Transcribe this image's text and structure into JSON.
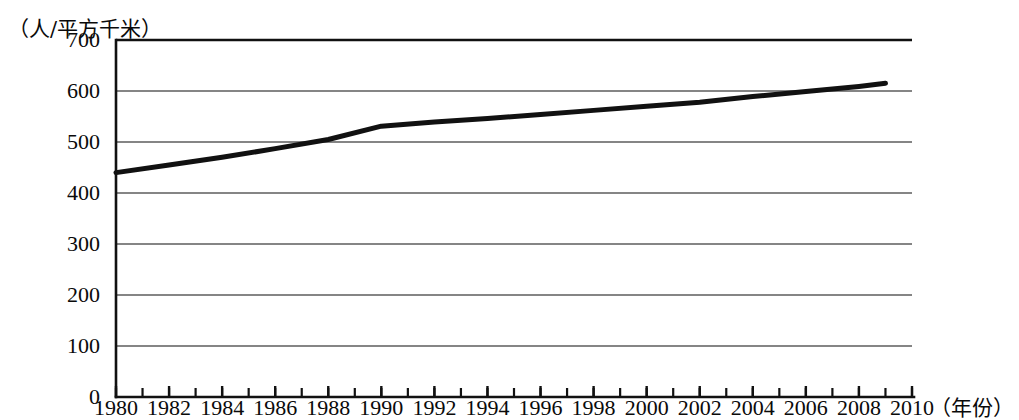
{
  "figure": {
    "y_axis_unit": "（人/平方千米）",
    "x_axis_unit": "（年份）"
  },
  "chart_data": {
    "type": "line",
    "title": "",
    "subtitle": "",
    "xlabel": "（年份）",
    "ylabel": "（人/平方千米）",
    "xlim": [
      1980,
      2010
    ],
    "ylim": [
      0,
      700
    ],
    "grid": "horizontal",
    "legend": "none",
    "x_tick_labels": [
      "1980",
      "1982",
      "1984",
      "1986",
      "1988",
      "1990",
      "1992",
      "1994",
      "1996",
      "1998",
      "2000",
      "2002",
      "2004",
      "2006",
      "2008",
      "2010"
    ],
    "x_tick_values": [
      1980,
      1982,
      1984,
      1986,
      1988,
      1990,
      1992,
      1994,
      1996,
      1998,
      2000,
      2002,
      2004,
      2006,
      2008,
      2010
    ],
    "x_minor_tick_interval": 1,
    "y_tick_labels": [
      "0",
      "100",
      "200",
      "300",
      "400",
      "500",
      "600",
      "700"
    ],
    "y_tick_values": [
      0,
      100,
      200,
      300,
      400,
      500,
      600,
      700
    ],
    "series": [
      {
        "name": "人口密度",
        "color": "#111111",
        "x": [
          1980,
          1982,
          1984,
          1986,
          1988,
          1990,
          1992,
          1994,
          1996,
          1998,
          2000,
          2002,
          2004,
          2006,
          2008,
          2009
        ],
        "values": [
          440,
          455,
          470,
          487,
          505,
          531,
          539,
          546,
          554,
          562,
          570,
          578,
          589,
          599,
          609,
          615
        ]
      }
    ]
  }
}
